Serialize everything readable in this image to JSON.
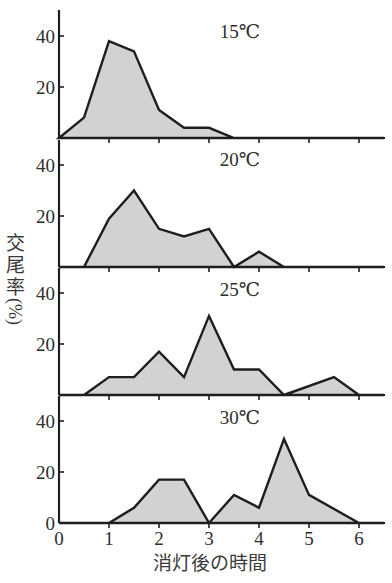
{
  "chart_data": {
    "type": "area",
    "title": "",
    "xlabel": "消灯後の時間",
    "ylabel": "交尾率（%）",
    "ylabel_chars": [
      "交",
      "尾",
      "率",
      "(%)"
    ],
    "x_ticks": [
      0,
      1,
      2,
      3,
      4,
      5,
      6
    ],
    "x_tick_labels": [
      "0",
      "1",
      "2",
      "3",
      "4",
      "5",
      "6"
    ],
    "xlim": [
      0,
      6.5
    ],
    "y_ticks": [
      20,
      40
    ],
    "y_tick_labels": [
      "20",
      "40"
    ],
    "bottom_panel_zero_label": "0",
    "ylim": [
      0,
      50
    ],
    "grid": false,
    "legend": null,
    "series": [
      {
        "name": "15℃",
        "x": [
          0,
          0.5,
          1,
          1.5,
          2,
          2.5,
          3,
          3.5,
          6.5
        ],
        "values": [
          0,
          8,
          38,
          34,
          11,
          4,
          4,
          0,
          0
        ]
      },
      {
        "name": "20℃",
        "x": [
          0,
          0.5,
          1,
          1.5,
          2,
          2.5,
          3,
          3.5,
          4,
          4.5,
          6.5
        ],
        "values": [
          0,
          0,
          19,
          30,
          15,
          12,
          15,
          0,
          6,
          0,
          0
        ]
      },
      {
        "name": "25℃",
        "x": [
          0,
          0.5,
          1,
          1.5,
          2,
          2.5,
          3,
          3.5,
          4,
          4.5,
          5.5,
          6,
          6.5
        ],
        "values": [
          0,
          0,
          7,
          7,
          17,
          7,
          31,
          10,
          10,
          0,
          7,
          0,
          0
        ]
      },
      {
        "name": "30℃",
        "x": [
          0,
          1,
          1.5,
          2,
          2.5,
          3,
          3.5,
          4,
          4.5,
          5,
          6,
          6.5
        ],
        "values": [
          0,
          0,
          6,
          17,
          17,
          0,
          11,
          6,
          33,
          11,
          0,
          0
        ]
      }
    ],
    "panels_layout": "4 vertically stacked small multiples sharing x-axis"
  },
  "colors": {
    "fill": "#d2d2d0",
    "line": "#1e1e1e",
    "text": "#2e2e2e"
  }
}
